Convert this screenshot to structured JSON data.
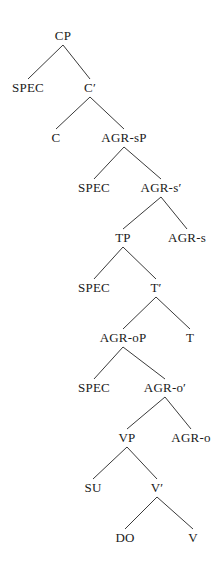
{
  "figure": {
    "kind": "syntax-tree-diagram",
    "title": "",
    "background_color": "#ffffff",
    "edge_color": "#3a3a3a",
    "text_color": "#1a1a1a",
    "width": 221,
    "height": 567
  },
  "tree": {
    "nodes": [
      {
        "id": "cp",
        "label": "CP",
        "x": 63,
        "y": 29
      },
      {
        "id": "spec1",
        "label": "SPEC",
        "x": 28,
        "y": 81
      },
      {
        "id": "cbar",
        "label": "C′",
        "x": 90,
        "y": 81
      },
      {
        "id": "c",
        "label": "C",
        "x": 56,
        "y": 131
      },
      {
        "id": "agrsp",
        "label": "AGR-sP",
        "x": 124,
        "y": 131
      },
      {
        "id": "spec2",
        "label": "SPEC",
        "x": 94,
        "y": 181
      },
      {
        "id": "agrsbar",
        "label": "AGR-s′",
        "x": 161,
        "y": 181
      },
      {
        "id": "tp",
        "label": "TP",
        "x": 123,
        "y": 231
      },
      {
        "id": "agrs",
        "label": "AGR-s",
        "x": 187,
        "y": 231
      },
      {
        "id": "spec3",
        "label": "SPEC",
        "x": 94,
        "y": 281
      },
      {
        "id": "tbar",
        "label": "T′",
        "x": 156,
        "y": 281
      },
      {
        "id": "agrop",
        "label": "AGR-oP",
        "x": 123,
        "y": 331
      },
      {
        "id": "t",
        "label": "T",
        "x": 190,
        "y": 331
      },
      {
        "id": "spec4",
        "label": "SPEC",
        "x": 94,
        "y": 381
      },
      {
        "id": "agrobar",
        "label": "AGR-o′",
        "x": 165,
        "y": 381
      },
      {
        "id": "vp",
        "label": "VP",
        "x": 127,
        "y": 431
      },
      {
        "id": "agro",
        "label": "AGR-o",
        "x": 191,
        "y": 431
      },
      {
        "id": "su",
        "label": "SU",
        "x": 93,
        "y": 481
      },
      {
        "id": "vbar",
        "label": "V′",
        "x": 157,
        "y": 481
      },
      {
        "id": "do",
        "label": "DO",
        "x": 125,
        "y": 531
      },
      {
        "id": "v",
        "label": "V",
        "x": 193,
        "y": 531
      }
    ],
    "edges": [
      {
        "from": "cp",
        "to": "spec1"
      },
      {
        "from": "cp",
        "to": "cbar"
      },
      {
        "from": "cbar",
        "to": "c"
      },
      {
        "from": "cbar",
        "to": "agrsp"
      },
      {
        "from": "agrsp",
        "to": "spec2"
      },
      {
        "from": "agrsp",
        "to": "agrsbar"
      },
      {
        "from": "agrsbar",
        "to": "tp"
      },
      {
        "from": "agrsbar",
        "to": "agrs"
      },
      {
        "from": "tp",
        "to": "spec3"
      },
      {
        "from": "tp",
        "to": "tbar"
      },
      {
        "from": "tbar",
        "to": "agrop"
      },
      {
        "from": "tbar",
        "to": "t"
      },
      {
        "from": "agrop",
        "to": "spec4"
      },
      {
        "from": "agrop",
        "to": "agrobar"
      },
      {
        "from": "agrobar",
        "to": "vp"
      },
      {
        "from": "agrobar",
        "to": "agro"
      },
      {
        "from": "vp",
        "to": "su"
      },
      {
        "from": "vp",
        "to": "vbar"
      },
      {
        "from": "vbar",
        "to": "do"
      },
      {
        "from": "vbar",
        "to": "v"
      }
    ]
  }
}
